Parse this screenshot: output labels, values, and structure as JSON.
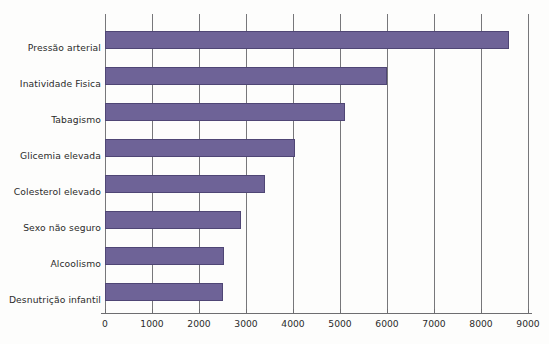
{
  "chart_data": {
    "type": "bar",
    "orientation": "horizontal",
    "title": "",
    "xlabel": "",
    "ylabel": "",
    "categories": [
      "Pressão arterial",
      "Inatividade Fisica",
      "Tabagismo",
      "Glicemia elevada",
      "Colesterol elevado",
      "Sexo não seguro",
      "Alcoolismo",
      "Desnutrição infantil"
    ],
    "values": [
      8600,
      6000,
      5100,
      4050,
      3400,
      2900,
      2530,
      2520
    ],
    "xlim": [
      0,
      9000
    ],
    "xticks": [
      0,
      1000,
      2000,
      3000,
      4000,
      5000,
      6000,
      7000,
      8000,
      9000
    ],
    "xtick_labels": [
      "0",
      "1000",
      "2000",
      "3000",
      "4000",
      "5000",
      "6000",
      "7000",
      "8000",
      "9000"
    ],
    "grid": "vertical",
    "legend": null,
    "bar_color": "#6e6397",
    "bar_border_color": "#4f4675",
    "grid_color": "#77777a",
    "axis_color": "#6d6d70",
    "text_color": "#2b2b2b",
    "background": "#fdfdfc"
  }
}
